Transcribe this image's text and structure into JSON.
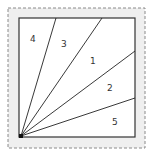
{
  "diagram": {
    "type": "fan-partition",
    "colors": {
      "outer_fill": "#efefef",
      "dashed_border": "#8a8a8a",
      "inner_fill": "#ffffff",
      "inner_border": "#333333",
      "lines": "#222222",
      "origin_dot": "#111111"
    },
    "regions": [
      {
        "label": "4",
        "x": 33,
        "y": 42
      },
      {
        "label": "3",
        "x": 64,
        "y": 47
      },
      {
        "label": "1",
        "x": 92,
        "y": 64
      },
      {
        "label": "2",
        "x": 109,
        "y": 91
      },
      {
        "label": "5",
        "x": 114,
        "y": 125
      }
    ]
  }
}
